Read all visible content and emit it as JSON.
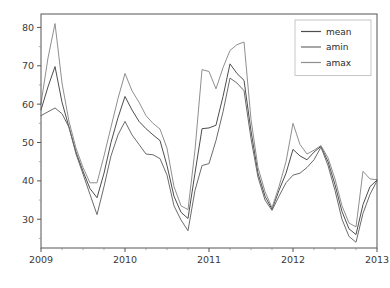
{
  "figure": {
    "background_color": "#ffffff",
    "axes_background_color": "#ffffff",
    "spine_color": "#555555",
    "width": 390,
    "height": 288
  },
  "chart_data": {
    "type": "line",
    "title": "",
    "xlabel": "",
    "ylabel": "",
    "xlim": [
      2009.0,
      2013.0
    ],
    "ylim": [
      22.5,
      83.5
    ],
    "grid": false,
    "legend_position": "upper right",
    "xticks": [
      2009,
      2010,
      2011,
      2012,
      2013
    ],
    "xtick_labels": [
      "2009",
      "2010",
      "2011",
      "2012",
      "2013"
    ],
    "yticks": [
      30,
      40,
      50,
      60,
      70,
      80
    ],
    "ytick_labels": [
      "30",
      "40",
      "50",
      "60",
      "70",
      "80"
    ],
    "x_minor_tick_interval": 0.25,
    "x": [
      2009.0,
      2009.083,
      2009.167,
      2009.25,
      2009.333,
      2009.417,
      2009.5,
      2009.583,
      2009.667,
      2009.75,
      2009.833,
      2009.917,
      2010.0,
      2010.083,
      2010.167,
      2010.25,
      2010.333,
      2010.417,
      2010.5,
      2010.583,
      2010.667,
      2010.75,
      2010.833,
      2010.917,
      2011.0,
      2011.083,
      2011.167,
      2011.25,
      2011.333,
      2011.417,
      2011.5,
      2011.583,
      2011.667,
      2011.75,
      2011.833,
      2011.917,
      2012.0,
      2012.083,
      2012.167,
      2012.25,
      2012.333,
      2012.417,
      2012.5,
      2012.583,
      2012.667,
      2012.75,
      2012.833,
      2012.917,
      2013.0
    ],
    "series": [
      {
        "name": "mean",
        "color": "#4d4d4d",
        "values": [
          58.5,
          64.5,
          69.8,
          60.5,
          54.0,
          47.5,
          42.5,
          38.0,
          35.6,
          42.0,
          50.0,
          56.5,
          62.0,
          58.5,
          55.5,
          53.6,
          52.0,
          50.5,
          44.0,
          36.0,
          31.8,
          30.2,
          42.0,
          53.6,
          53.8,
          54.5,
          62.0,
          70.5,
          68.0,
          66.2,
          53.0,
          42.0,
          36.0,
          32.6,
          37.5,
          42.0,
          48.2,
          46.5,
          45.5,
          47.5,
          49.0,
          45.0,
          39.0,
          32.0,
          27.5,
          26.0,
          33.8,
          38.5,
          40.2
        ]
      },
      {
        "name": "amin",
        "color": "#6b6b6b",
        "values": [
          57.0,
          58.0,
          59.0,
          57.5,
          54.0,
          47.0,
          41.8,
          36.5,
          31.2,
          38.5,
          46.5,
          52.0,
          55.5,
          52.0,
          49.5,
          47.0,
          46.8,
          45.8,
          41.5,
          33.5,
          29.8,
          27.0,
          37.5,
          44.0,
          44.5,
          50.5,
          58.0,
          66.8,
          65.5,
          63.5,
          51.0,
          41.0,
          35.0,
          32.3,
          36.0,
          39.5,
          41.5,
          42.0,
          43.5,
          45.5,
          48.8,
          44.0,
          37.5,
          30.0,
          25.5,
          24.0,
          31.5,
          36.5,
          40.0
        ]
      },
      {
        "name": "amax",
        "color": "#8f8f8f",
        "values": [
          60.2,
          72.0,
          81.0,
          65.5,
          55.5,
          48.5,
          43.5,
          39.5,
          39.5,
          46.5,
          54.0,
          61.5,
          68.0,
          63.5,
          60.5,
          57.0,
          55.0,
          53.5,
          48.5,
          38.5,
          33.5,
          32.5,
          48.0,
          69.0,
          68.5,
          64.0,
          69.5,
          74.0,
          75.5,
          76.2,
          56.0,
          43.5,
          37.2,
          33.0,
          38.5,
          45.0,
          55.0,
          49.5,
          47.0,
          48.0,
          49.2,
          46.0,
          40.5,
          33.5,
          29.0,
          28.0,
          42.5,
          40.5,
          40.3
        ]
      }
    ],
    "legend_entries": [
      {
        "label": "mean",
        "color": "#4d4d4d"
      },
      {
        "label": "amin",
        "color": "#6b6b6b"
      },
      {
        "label": "amax",
        "color": "#8f8f8f"
      }
    ]
  }
}
